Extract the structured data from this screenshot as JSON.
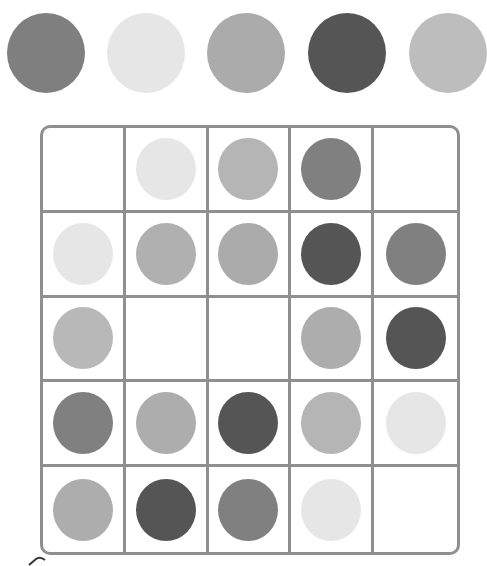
{
  "colors": {
    "c1": "#7f7f7f",
    "c2": "#e6e6e6",
    "c3": "#ababab",
    "c4": "#555555",
    "c5": "#bdbdbd",
    "grid": "#8f8f8f"
  },
  "palette": [
    {
      "color": "#7f7f7f",
      "x": 7
    },
    {
      "color": "#e6e6e6",
      "x": 107
    },
    {
      "color": "#ababab",
      "x": 207
    },
    {
      "color": "#555555",
      "x": 308
    },
    {
      "color": "#bdbdbd",
      "x": 409
    }
  ],
  "board": {
    "rows": 5,
    "cols": 5,
    "cells": [
      [
        null,
        "#e6e6e6",
        "#b5b5b5",
        "#808080",
        null
      ],
      [
        "#e6e6e6",
        "#b0b0b0",
        "#ababab",
        "#555555",
        "#808080"
      ],
      [
        "#b8b8b8",
        null,
        null,
        "#adadad",
        "#555555"
      ],
      [
        "#808080",
        "#adadad",
        "#555555",
        "#b5b5b5",
        "#e6e6e6"
      ],
      [
        "#adadad",
        "#555555",
        "#808080",
        "#e6e6e6",
        null
      ]
    ]
  }
}
